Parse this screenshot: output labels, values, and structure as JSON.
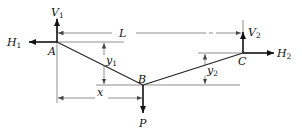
{
  "diagram": {
    "type": "cable-statics",
    "points": {
      "A": {
        "label": "A",
        "x": 57,
        "y": 42
      },
      "B": {
        "label": "B",
        "x": 143,
        "y": 85
      },
      "C": {
        "label": "C",
        "x": 243,
        "y": 53
      }
    },
    "forces": {
      "H1": {
        "label": "H",
        "sub": "1",
        "direction": "left",
        "at": "A"
      },
      "V1": {
        "label": "V",
        "sub": "1",
        "direction": "up",
        "at": "A"
      },
      "H2": {
        "label": "H",
        "sub": "2",
        "direction": "right",
        "at": "C"
      },
      "V2": {
        "label": "V",
        "sub": "2",
        "direction": "up",
        "at": "C"
      },
      "P": {
        "label": "P",
        "direction": "down",
        "at": "B"
      }
    },
    "dimensions": {
      "L": {
        "label": "L",
        "from": "A",
        "to": "C",
        "orientation": "horizontal"
      },
      "x": {
        "label": "x",
        "from": "A",
        "to": "B",
        "orientation": "horizontal"
      },
      "y1": {
        "label": "y",
        "sub": "1",
        "from": "A",
        "to": "B",
        "orientation": "vertical"
      },
      "y2": {
        "label": "y",
        "sub": "2",
        "from": "C",
        "to": "B",
        "orientation": "vertical"
      }
    },
    "colors": {
      "line": "#222222",
      "background": "#ffffff"
    }
  }
}
